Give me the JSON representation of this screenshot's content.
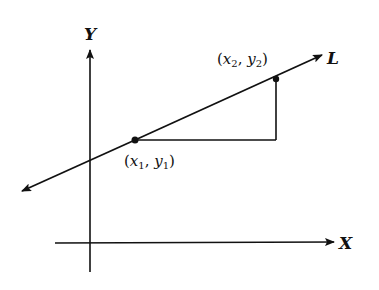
{
  "diagram": {
    "axes": {
      "x_label": "X",
      "y_label": "Y"
    },
    "line": {
      "label": "L"
    },
    "points": [
      {
        "name": "point-1",
        "open": "(",
        "x_var": "x",
        "x_sub": "1",
        "sep": ", ",
        "y_var": "y",
        "y_sub": "1",
        "close": ")"
      },
      {
        "name": "point-2",
        "open": "(",
        "x_var": "x",
        "x_sub": "2",
        "sep": ", ",
        "y_var": "y",
        "y_sub": "2",
        "close": ")"
      }
    ],
    "colors": {
      "stroke": "#111111",
      "background": "#ffffff"
    }
  }
}
